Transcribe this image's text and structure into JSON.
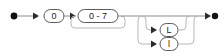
{
  "diagram": {
    "kind": "railroad-syntax-diagram",
    "width": 224,
    "height": 55,
    "colors": {
      "background": "#fefefe",
      "rail": "#8e8e8e",
      "rail_faint": "#b9b9b9",
      "box_stroke": "#5a5a5a",
      "box_fill": "#ffffff",
      "text": "#1b1b1b",
      "marker": "#111111"
    },
    "start_marker": "filled-dot",
    "end_marker": "arrow-filled-dot",
    "nodes": [
      {
        "id": "zero-prefix",
        "label": "0",
        "shape": "rounded-terminal",
        "x": 44,
        "y": 16,
        "w": 20,
        "h": 13,
        "repeatable": false,
        "optional": false
      },
      {
        "id": "octal-digit",
        "label": "0 - 7",
        "shape": "rounded-terminal",
        "x": 78,
        "y": 16,
        "w": 40,
        "h": 13,
        "repeatable": true,
        "optional": false
      },
      {
        "id": "suffix-upper-l",
        "label": "L",
        "shape": "rounded-terminal",
        "x": 160,
        "y": 30,
        "w": 18,
        "h": 13,
        "repeatable": false,
        "optional": true
      },
      {
        "id": "suffix-lower-l",
        "label": "l",
        "shape": "rounded-terminal",
        "x": 160,
        "y": 44,
        "w": 18,
        "h": 13,
        "repeatable": false,
        "optional": true
      }
    ],
    "arrowheads": [
      {
        "id": "arrow-to-zero-prefix",
        "x": 36,
        "y": 16
      },
      {
        "id": "arrow-to-octal-digit",
        "x": 73,
        "y": 16
      },
      {
        "id": "arrow-to-suffix-upper-l",
        "x": 153,
        "y": 30
      },
      {
        "id": "arrow-to-suffix-lower-l",
        "x": 153,
        "y": 44
      },
      {
        "id": "arrow-to-end",
        "x": 208,
        "y": 16
      }
    ],
    "markers": {
      "start_dot": {
        "x": 14,
        "y": 16,
        "r": 3.4
      },
      "end_dot": {
        "x": 215,
        "y": 16,
        "r": 3.2
      }
    }
  }
}
